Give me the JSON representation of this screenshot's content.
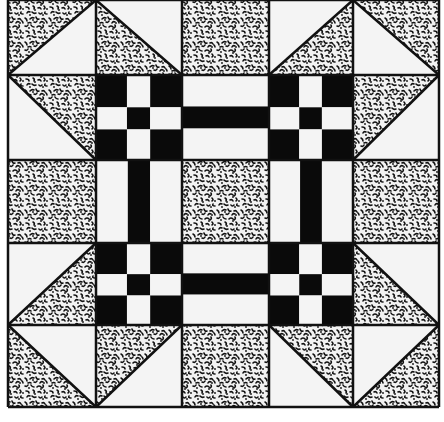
{
  "colors": {
    "background": "#ffffff",
    "line": "#111111",
    "solid": "#0a0a0a",
    "light": "#f4f4f4",
    "speckle_base": "#f2f2f2",
    "speckle_dot": "#111111"
  },
  "grid": {
    "cols": [
      8,
      96,
      182,
      269,
      353,
      439
    ],
    "rows": [
      0,
      75,
      160,
      243,
      325,
      407
    ]
  },
  "cells": [
    [
      {
        "type": "hst",
        "dark": "ul"
      },
      {
        "type": "hst",
        "dark": "ll"
      },
      {
        "type": "speckle"
      },
      {
        "type": "hst",
        "dark": "lr"
      },
      {
        "type": "hst",
        "dark": "ur"
      }
    ],
    [
      {
        "type": "hst",
        "dark": "ur"
      },
      {
        "type": "ninepatch"
      },
      {
        "type": "bars",
        "dir": "h"
      },
      {
        "type": "ninepatch"
      },
      {
        "type": "hst",
        "dark": "ul"
      }
    ],
    [
      {
        "type": "speckle"
      },
      {
        "type": "bars",
        "dir": "v"
      },
      {
        "type": "speckle"
      },
      {
        "type": "bars",
        "dir": "v"
      },
      {
        "type": "speckle"
      }
    ],
    [
      {
        "type": "hst",
        "dark": "lr"
      },
      {
        "type": "ninepatch"
      },
      {
        "type": "bars",
        "dir": "h"
      },
      {
        "type": "ninepatch"
      },
      {
        "type": "hst",
        "dark": "ll"
      }
    ],
    [
      {
        "type": "hst",
        "dark": "ll"
      },
      {
        "type": "hst",
        "dark": "ul"
      },
      {
        "type": "speckle"
      },
      {
        "type": "hst",
        "dark": "ur"
      },
      {
        "type": "hst",
        "dark": "lr"
      }
    ]
  ]
}
